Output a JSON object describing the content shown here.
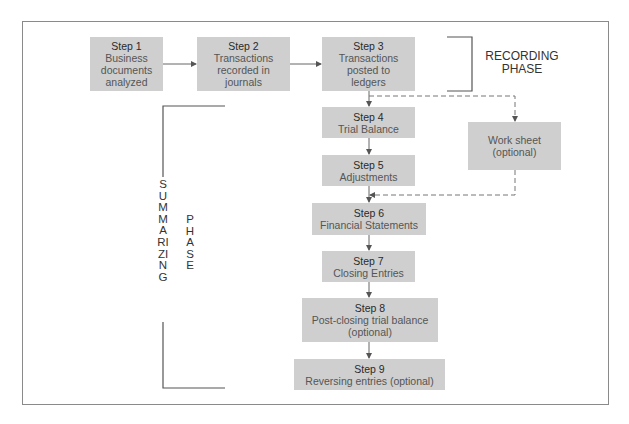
{
  "diagram": {
    "type": "flowchart",
    "recording_phase": {
      "label_line1": "RECORDING",
      "label_line2": "PHASE"
    },
    "summarizing_phase": {
      "word1": "SUMMARIZING",
      "word2": "PHASE"
    },
    "steps": [
      {
        "id": "step1",
        "step": "Step 1",
        "lines": [
          "Business",
          "documents",
          "analyzed"
        ]
      },
      {
        "id": "step2",
        "step": "Step 2",
        "lines": [
          "Transactions",
          "recorded in",
          "journals"
        ]
      },
      {
        "id": "step3",
        "step": "Step 3",
        "lines": [
          "Transactions",
          "posted to",
          "ledgers"
        ]
      },
      {
        "id": "step4",
        "step": "Step 4",
        "lines": [
          "Trial Balance"
        ]
      },
      {
        "id": "step5",
        "step": "Step 5",
        "lines": [
          "Adjustments"
        ]
      },
      {
        "id": "step6",
        "step": "Step 6",
        "lines": [
          "Financial Statements"
        ]
      },
      {
        "id": "step7",
        "step": "Step 7",
        "lines": [
          "Closing Entries"
        ]
      },
      {
        "id": "step8",
        "step": "Step 8",
        "lines": [
          "Post-closing trial balance",
          "(optional)"
        ]
      },
      {
        "id": "step9",
        "step": "Step 9",
        "lines": [
          "Reversing entries (optional)"
        ]
      }
    ],
    "worksheet": {
      "lines": [
        "Work sheet",
        "(optional)"
      ]
    },
    "edges": [
      {
        "from": "step1",
        "to": "step2",
        "style": "solid"
      },
      {
        "from": "step2",
        "to": "step3",
        "style": "solid"
      },
      {
        "from": "step3",
        "to": "step4",
        "style": "solid"
      },
      {
        "from": "step3",
        "to": "worksheet",
        "style": "dashed"
      },
      {
        "from": "step4",
        "to": "step5",
        "style": "solid"
      },
      {
        "from": "worksheet",
        "to": "step6",
        "style": "dashed"
      },
      {
        "from": "step5",
        "to": "step6",
        "style": "solid"
      },
      {
        "from": "step6",
        "to": "step7",
        "style": "solid"
      },
      {
        "from": "step7",
        "to": "step8",
        "style": "solid"
      },
      {
        "from": "step8",
        "to": "step9",
        "style": "solid"
      }
    ]
  }
}
